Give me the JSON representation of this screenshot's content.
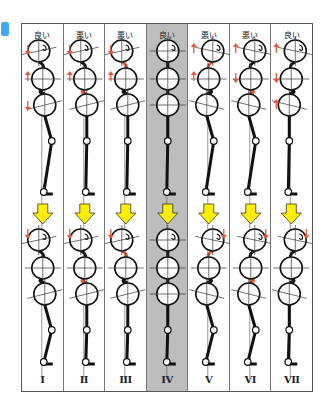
{
  "figure": {
    "tag": "",
    "columns": [
      {
        "id": "I",
        "label": "I",
        "verdict": "良い",
        "shaded": false,
        "top_pelvis_tilt": -14,
        "top_chest_tilt": -14,
        "top_head_tilt": -12,
        "top_arrows": [
          "down",
          "up",
          "down"
        ],
        "top_red": [],
        "bot_red": [],
        "bot_tilt": -14,
        "knee_bent": true
      },
      {
        "id": "II",
        "label": "II",
        "verdict": "悪い",
        "shaded": false,
        "top_pelvis_tilt": -14,
        "top_chest_tilt": -14,
        "top_head_tilt": -12,
        "top_arrows": [
          "down",
          "up"
        ],
        "top_red": [
          "lumbar"
        ],
        "bot_red": [
          "lumbar"
        ],
        "bot_tilt": -14,
        "knee_bent": false
      },
      {
        "id": "III",
        "label": "III",
        "verdict": "悪い",
        "shaded": false,
        "top_pelvis_tilt": -14,
        "top_chest_tilt": -14,
        "top_head_tilt": -12,
        "top_arrows": [
          "down",
          "up"
        ],
        "top_red": [
          "thoracic"
        ],
        "bot_red": [
          "thoracic"
        ],
        "bot_tilt": -14,
        "knee_bent": false
      },
      {
        "id": "IV",
        "label": "IV",
        "verdict": "良い",
        "shaded": true,
        "top_pelvis_tilt": 0,
        "top_chest_tilt": 0,
        "top_head_tilt": 0,
        "top_arrows": [],
        "top_red": [],
        "bot_red": [],
        "bot_tilt": 0,
        "knee_bent": false
      },
      {
        "id": "V",
        "label": "V",
        "verdict": "悪い",
        "shaded": false,
        "top_pelvis_tilt": 14,
        "top_chest_tilt": 14,
        "top_head_tilt": 12,
        "top_arrows": [
          "up",
          "up"
        ],
        "top_red": [
          "thoracic"
        ],
        "bot_red": [
          "thoracic"
        ],
        "bot_tilt": 14,
        "knee_bent": true
      },
      {
        "id": "VI",
        "label": "VI",
        "verdict": "悪い",
        "shaded": false,
        "top_pelvis_tilt": 14,
        "top_chest_tilt": 14,
        "top_head_tilt": 12,
        "top_arrows": [
          "up",
          "down"
        ],
        "top_red": [
          "lumbar"
        ],
        "bot_red": [
          "lumbar"
        ],
        "bot_tilt": 14,
        "knee_bent": true
      },
      {
        "id": "VII",
        "label": "VII",
        "verdict": "良い",
        "shaded": false,
        "top_pelvis_tilt": 14,
        "top_chest_tilt": 14,
        "top_head_tilt": 12,
        "top_arrows": [
          "up",
          "down",
          "up"
        ],
        "top_red": [],
        "bot_red": [],
        "bot_tilt": 14,
        "knee_bent": false
      }
    ],
    "colors": {
      "red_arrow": "#e8553a",
      "yellow_arrow": "#ffee00",
      "shaded_column": "#bdbdbd",
      "line": "#111111"
    }
  }
}
